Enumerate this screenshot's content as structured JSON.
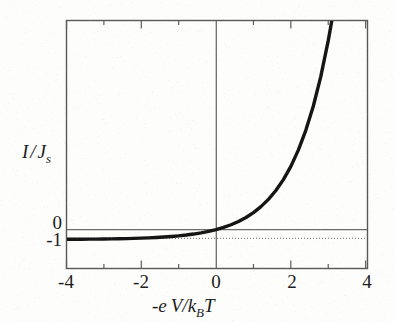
{
  "figure": {
    "background_color": "#fdfdfc",
    "frame_color": "#585858",
    "curve_color": "#151515",
    "zero_line_color": "#6b6b6b",
    "asymptote_color": "#8a8a8a"
  },
  "axis_titles": {
    "y_main": "I",
    "y_slash": "/",
    "y_second": "J",
    "y_second_sub": "s",
    "x_lead": "-e",
    "x_main": "V/k",
    "x_main_sub": "B",
    "x_tail": "T"
  },
  "chart_data": {
    "type": "line",
    "title": "",
    "subtitle": "",
    "xlabel": "-e V/k_B T",
    "ylabel": "I / J_s",
    "xlim": [
      -4,
      4.05
    ],
    "ylim": [
      -2.1,
      21.2
    ],
    "grid": false,
    "legend": null,
    "x_ticks_major": [
      -4,
      -2,
      0,
      2,
      4
    ],
    "x_ticks_minor": [
      -3,
      -1,
      1,
      3
    ],
    "x_tick_labels": [
      "-4",
      "-2",
      "0",
      "2",
      "4"
    ],
    "y_ticks": [
      0,
      -1
    ],
    "y_tick_labels": [
      "0",
      "-1"
    ],
    "equation": "I/J_s = exp(-eV/k_BT) - 1",
    "annotations": [
      {
        "name": "zero-line",
        "type": "horizontal-line",
        "y": 0,
        "style": "solid"
      },
      {
        "name": "saturation-asymptote",
        "type": "horizontal-line",
        "y": -1,
        "style": "dotted"
      },
      {
        "name": "zero-voltage-line",
        "type": "vertical-line",
        "x": 0,
        "style": "solid"
      }
    ],
    "series": [
      {
        "name": "diode-characteristic",
        "style": "solid",
        "linewidth": 3.4,
        "x": [
          -4.0,
          -3.8,
          -3.6,
          -3.4,
          -3.2,
          -3.0,
          -2.8,
          -2.6,
          -2.4,
          -2.2,
          -2.0,
          -1.8,
          -1.6,
          -1.4,
          -1.2,
          -1.0,
          -0.8,
          -0.6,
          -0.4,
          -0.2,
          0.0,
          0.2,
          0.4,
          0.6,
          0.8,
          1.0,
          1.2,
          1.4,
          1.6,
          1.8,
          2.0,
          2.2,
          2.4,
          2.6,
          2.8,
          3.0,
          3.1
        ],
        "y": [
          -0.982,
          -0.978,
          -0.973,
          -0.967,
          -0.959,
          -0.95,
          -0.939,
          -0.926,
          -0.909,
          -0.889,
          -0.865,
          -0.835,
          -0.798,
          -0.753,
          -0.699,
          -0.632,
          -0.551,
          -0.451,
          -0.33,
          -0.181,
          0.0,
          0.221,
          0.492,
          0.822,
          1.226,
          1.718,
          2.32,
          3.055,
          3.953,
          5.05,
          6.389,
          8.025,
          10.023,
          12.464,
          15.445,
          19.086,
          21.198
        ]
      }
    ]
  }
}
